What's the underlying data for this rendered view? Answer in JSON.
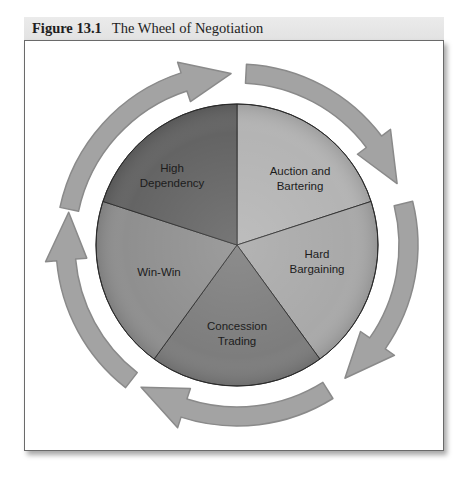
{
  "figure": {
    "number": "Figure 13.1",
    "title": "The Wheel of Negotiation"
  },
  "wheel": {
    "center": [
      237,
      245
    ],
    "radius": 141,
    "slices": [
      {
        "lines": [
          "Auction and",
          "Bartering"
        ],
        "start_deg": -90,
        "end_deg": -18,
        "color": "#b4b4b4",
        "label_pos": [
          300,
          178
        ]
      },
      {
        "lines": [
          "Hard",
          "Bargaining"
        ],
        "start_deg": -18,
        "end_deg": 54,
        "color": "#a9a9a9",
        "label_pos": [
          317,
          261
        ]
      },
      {
        "lines": [
          "Concession",
          "Trading"
        ],
        "start_deg": 54,
        "end_deg": 126,
        "color": "#7d7d7d",
        "label_pos": [
          237,
          333
        ]
      },
      {
        "lines": [
          "Win-Win"
        ],
        "start_deg": 126,
        "end_deg": 198,
        "color": "#8f8f8f",
        "label_pos": [
          159,
          272
        ]
      },
      {
        "lines": [
          "High",
          "Dependency"
        ],
        "start_deg": 198,
        "end_deg": 270,
        "color": "#646464",
        "label_pos": [
          172,
          175
        ]
      }
    ]
  },
  "arrows": {
    "color": "#a3a3a3",
    "edge_color": "#8a8a8a",
    "inner_radius": 162,
    "outer_radius": 181,
    "items": [
      {
        "from_deg": 192,
        "to_deg": 268,
        "direction": "clockwise"
      },
      {
        "from_deg": 273,
        "to_deg": 339,
        "direction": "clockwise"
      },
      {
        "from_deg": 346,
        "to_deg": 411,
        "direction": "clockwise"
      },
      {
        "from_deg": 58,
        "to_deg": 124,
        "direction": "clockwise"
      },
      {
        "from_deg": 128,
        "to_deg": 191,
        "direction": "counterclockwise-visual-up"
      }
    ]
  }
}
